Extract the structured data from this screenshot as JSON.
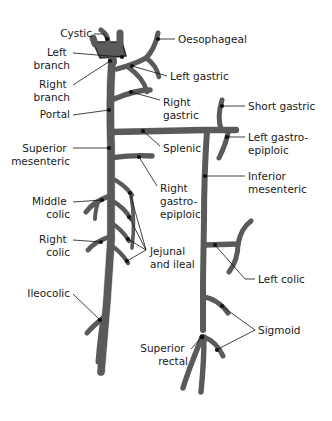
{
  "diagram": {
    "vessel_fill": "#5a5a5a",
    "vessel_stroke": "#2e2e2e",
    "leader_color": "#111111",
    "text_color": "#1a1a1a",
    "background": "#ffffff"
  },
  "labels": [
    {
      "id": "cystic",
      "text": "Cystic",
      "lines": [
        "Cystic"
      ],
      "align": "end",
      "x": 92,
      "y": 37
    },
    {
      "id": "left-branch",
      "text": "Left branch",
      "lines": [
        "Left",
        "branch"
      ],
      "align": "end",
      "x": 70,
      "y": 56
    },
    {
      "id": "right-branch",
      "text": "Right branch",
      "lines": [
        "Right",
        "branch"
      ],
      "align": "end",
      "x": 70,
      "y": 88
    },
    {
      "id": "portal",
      "text": "Portal",
      "lines": [
        "Portal"
      ],
      "align": "end",
      "x": 70,
      "y": 118
    },
    {
      "id": "superior-mesenteric",
      "text": "Superior mesenteric",
      "lines": [
        "Superior",
        "mesenteric"
      ],
      "align": "end",
      "x": 70,
      "y": 152
    },
    {
      "id": "middle-colic",
      "text": "Middle colic",
      "lines": [
        "Middle",
        "colic"
      ],
      "align": "end",
      "x": 70,
      "y": 205
    },
    {
      "id": "right-colic",
      "text": "Right colic",
      "lines": [
        "Right",
        "colic"
      ],
      "align": "end",
      "x": 70,
      "y": 243
    },
    {
      "id": "ileocolic",
      "text": "Ileocolic",
      "lines": [
        "Ileocolic"
      ],
      "align": "end",
      "x": 70,
      "y": 297
    },
    {
      "id": "oesophageal",
      "text": "Oesophageal",
      "lines": [
        "Oesophageal"
      ],
      "align": "start",
      "x": 178,
      "y": 43
    },
    {
      "id": "left-gastric",
      "text": "Left gastric",
      "lines": [
        "Left gastric"
      ],
      "align": "start",
      "x": 170,
      "y": 80
    },
    {
      "id": "right-gastric",
      "text": "Right gastric",
      "lines": [
        "Right",
        "gastric"
      ],
      "align": "start",
      "x": 163,
      "y": 106
    },
    {
      "id": "splenic",
      "text": "Splenic",
      "lines": [
        "Splenic"
      ],
      "align": "start",
      "x": 163,
      "y": 152
    },
    {
      "id": "right-gastroepiploic",
      "text": "Right gastro-epiploic",
      "lines": [
        "Right",
        "gastro-",
        "epiploic"
      ],
      "align": "start",
      "x": 160,
      "y": 192
    },
    {
      "id": "jejunal-and-ileal",
      "text": "Jejunal and ileal",
      "lines": [
        "Jejunal",
        "and ileal"
      ],
      "align": "start",
      "x": 150,
      "y": 255
    },
    {
      "id": "superior-rectal",
      "text": "Superior rectal",
      "lines": [
        "Superior",
        "rectal"
      ],
      "align": "end",
      "x": 188,
      "y": 352
    },
    {
      "id": "short-gastric",
      "text": "Short gastric",
      "lines": [
        "Short gastric"
      ],
      "align": "start",
      "x": 248,
      "y": 110
    },
    {
      "id": "left-gastroepiploic",
      "text": "Left gastro-epiploic",
      "lines": [
        "Left gastro-",
        "epiploic"
      ],
      "align": "start",
      "x": 248,
      "y": 141
    },
    {
      "id": "inferior-mesenteric",
      "text": "Inferior mesenteric",
      "lines": [
        "Inferior",
        "mesenteric"
      ],
      "align": "start",
      "x": 248,
      "y": 180
    },
    {
      "id": "left-colic",
      "text": "Left colic",
      "lines": [
        "Left colic"
      ],
      "align": "start",
      "x": 258,
      "y": 283
    },
    {
      "id": "sigmoid",
      "text": "Sigmoid",
      "lines": [
        "Sigmoid"
      ],
      "align": "start",
      "x": 258,
      "y": 334
    }
  ]
}
